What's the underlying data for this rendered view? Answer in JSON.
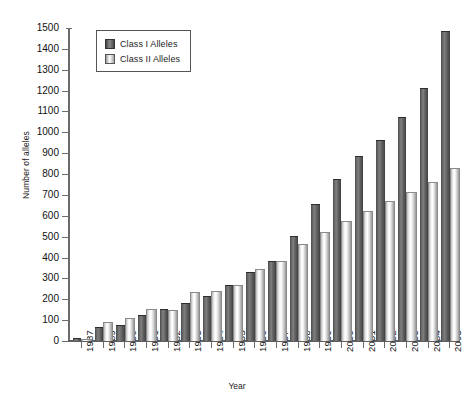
{
  "chart_data": {
    "type": "bar",
    "title": "",
    "xlabel": "Year",
    "ylabel": "Number of alleles",
    "ylim": [
      0,
      1500
    ],
    "ytick_step": 100,
    "yticks": [
      0,
      100,
      200,
      300,
      400,
      500,
      600,
      700,
      800,
      900,
      1000,
      1100,
      1200,
      1300,
      1400,
      1500
    ],
    "grid": false,
    "legend_position": "top-left",
    "categories": [
      "1987",
      "1989",
      "1990",
      "1991",
      "1992",
      "1993",
      "1994",
      "1995",
      "1996",
      "1997",
      "1998",
      "1999",
      "2000",
      "2001",
      "2002",
      "2003",
      "2004",
      "2005"
    ],
    "series": [
      {
        "name": "Class I Alleles",
        "color": "#5a5a5a",
        "values": [
          10,
          60,
          70,
          120,
          150,
          175,
          210,
          265,
          325,
          380,
          500,
          650,
          770,
          880,
          960,
          1070,
          1210,
          1480
        ]
      },
      {
        "name": "Class II Alleles",
        "color": "#e8e8e8",
        "values": [
          5,
          85,
          105,
          150,
          145,
          230,
          235,
          265,
          340,
          380,
          460,
          520,
          570,
          620,
          665,
          710,
          755,
          825
        ]
      }
    ]
  },
  "legend": {
    "items": [
      {
        "label": "Class I Alleles",
        "swatch": "classI"
      },
      {
        "label": "Class II Alleles",
        "swatch": "classII"
      }
    ]
  },
  "axes": {
    "y_title": "Number of alleles",
    "x_title": "Year"
  }
}
